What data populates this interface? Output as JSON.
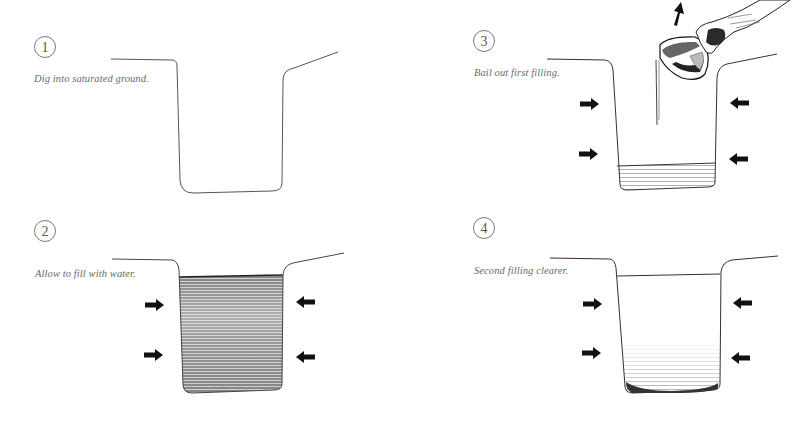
{
  "figure": {
    "steps": [
      {
        "number": "1",
        "caption": "Dig into saturated ground."
      },
      {
        "number": "2",
        "caption": "Allow to fill with water."
      },
      {
        "number": "3",
        "caption": "Bail out first filling."
      },
      {
        "number": "4",
        "caption": "Second filling clearer."
      }
    ],
    "icons": {
      "inflow_arrows": "seepage-arrow-icon",
      "bailing": "hand-pouring-pot-icon",
      "lift_arrow": "up-arrow-icon"
    },
    "colors": {
      "ink": "#111111",
      "line": "#555555",
      "water_dark": "#3a3a3a",
      "water_light": "#9a9a9a",
      "caption": "#6a6a6a"
    }
  }
}
